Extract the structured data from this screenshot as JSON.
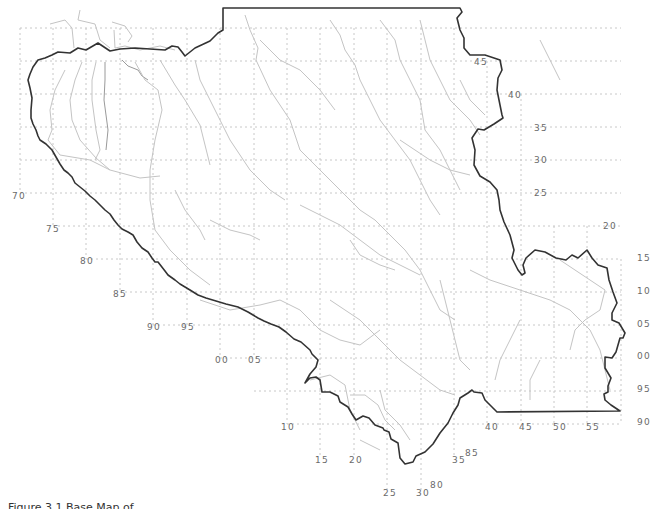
{
  "map": {
    "type": "regional graticule map",
    "colors": {
      "border": "#333333",
      "rivers": "#c4c4c4",
      "grid": "#c8c8c8",
      "labels": "#6a6a6a"
    },
    "right_labels": [
      {
        "text": "45",
        "x": 474,
        "y": 65
      },
      {
        "text": "40",
        "x": 508,
        "y": 98
      },
      {
        "text": "35",
        "x": 534,
        "y": 131
      },
      {
        "text": "30",
        "x": 534,
        "y": 163
      },
      {
        "text": "25",
        "x": 534,
        "y": 196
      },
      {
        "text": "20",
        "x": 603,
        "y": 229
      },
      {
        "text": "15",
        "x": 637,
        "y": 261
      },
      {
        "text": "10",
        "x": 637,
        "y": 294
      },
      {
        "text": "05",
        "x": 637,
        "y": 327
      },
      {
        "text": "00",
        "x": 637,
        "y": 359
      },
      {
        "text": "95",
        "x": 637,
        "y": 392
      },
      {
        "text": "90",
        "x": 637,
        "y": 425
      }
    ],
    "left_labels": [
      {
        "text": "70",
        "x": 12,
        "y": 199
      },
      {
        "text": "75",
        "x": 46,
        "y": 232
      },
      {
        "text": "80",
        "x": 80,
        "y": 264
      },
      {
        "text": "85",
        "x": 113,
        "y": 297
      },
      {
        "text": "90",
        "x": 147,
        "y": 330
      },
      {
        "text": "95",
        "x": 181,
        "y": 330
      },
      {
        "text": "00",
        "x": 215,
        "y": 363
      },
      {
        "text": "05",
        "x": 248,
        "y": 363
      }
    ],
    "bottom_labels": [
      {
        "text": "10",
        "x": 281,
        "y": 430
      },
      {
        "text": "15",
        "x": 315,
        "y": 463
      },
      {
        "text": "20",
        "x": 349,
        "y": 463
      },
      {
        "text": "25",
        "x": 383,
        "y": 496
      },
      {
        "text": "30",
        "x": 416,
        "y": 496
      },
      {
        "text": "80",
        "x": 430,
        "y": 488
      },
      {
        "text": "35",
        "x": 452,
        "y": 463
      },
      {
        "text": "85",
        "x": 465,
        "y": 456
      },
      {
        "text": "40",
        "x": 485,
        "y": 430
      },
      {
        "text": "45",
        "x": 519,
        "y": 430
      },
      {
        "text": "50",
        "x": 553,
        "y": 430
      },
      {
        "text": "55",
        "x": 586,
        "y": 430
      }
    ]
  },
  "caption": "Figure 3.1   Base Map of ..."
}
